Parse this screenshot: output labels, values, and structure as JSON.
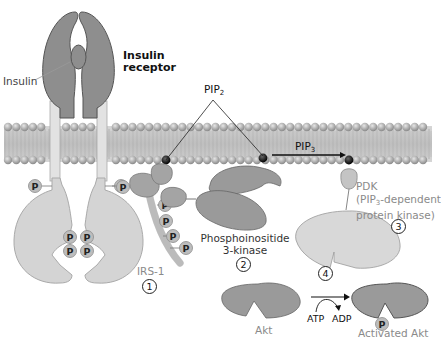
{
  "diagram": {
    "labels": {
      "insulin": "Insulin",
      "insulin_receptor_line1": "Insulin",
      "insulin_receptor_line2": "receptor",
      "pip2": "PIP",
      "pip2_sub": "2",
      "pip3": "PIP",
      "pip3_sub": "3",
      "irs1": "IRS-1",
      "pi3k_line1": "Phosphoinositide",
      "pi3k_line2": "3-kinase",
      "pdk_line1": "PDK",
      "pdk_line2_pre": "(PIP",
      "pdk_line2_sub": "3",
      "pdk_line2_post": "-dependent",
      "pdk_line3": "protein kinase)",
      "akt": "Akt",
      "activated_akt": "Activated Akt",
      "atp": "ATP",
      "adp": "ADP",
      "phosphate": "P"
    },
    "steps": [
      "1",
      "2",
      "3",
      "4"
    ],
    "colors": {
      "protein_dark": "#8e8e8e",
      "protein_light": "#d2d2d2",
      "membrane_head": "#a8a8a8",
      "membrane_tail": "#b8b8b8",
      "phosphate": "#bdbdbd",
      "text_gray": "#8a8a8a"
    }
  }
}
